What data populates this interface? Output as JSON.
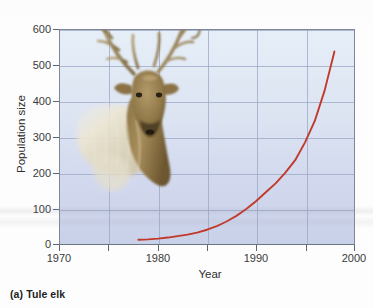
{
  "figure": {
    "caption": "(a) Tule elk",
    "photo_subject": "tule-elk-bull"
  },
  "chart_data": {
    "type": "line",
    "title": "",
    "subtitle": "",
    "xlabel": "Year",
    "ylabel": "Population size",
    "xlim": [
      1970,
      2000
    ],
    "ylim": [
      0,
      600
    ],
    "grid": true,
    "legend": null,
    "x_ticks_major": [
      1970,
      1980,
      1990,
      2000
    ],
    "x_ticks_minor": [
      1975,
      1985,
      1995
    ],
    "x_tick_labels": [
      "1970",
      "1980",
      "1990",
      "2000"
    ],
    "y_ticks": [
      0,
      100,
      200,
      300,
      400,
      500,
      600
    ],
    "y_tick_labels": [
      "0",
      "100",
      "200",
      "300",
      "400",
      "500",
      "600"
    ],
    "series": [
      {
        "name": "Tule elk population",
        "color": "#c0392b",
        "x": [
          1978,
          1979,
          1980,
          1981,
          1982,
          1983,
          1984,
          1985,
          1986,
          1987,
          1988,
          1989,
          1990,
          1991,
          1992,
          1993,
          1994,
          1995,
          1996,
          1997,
          1998
        ],
        "values": [
          12,
          13,
          15,
          18,
          22,
          26,
          32,
          40,
          50,
          63,
          79,
          98,
          120,
          145,
          170,
          200,
          235,
          285,
          345,
          430,
          540
        ]
      }
    ],
    "annotations": []
  },
  "colors": {
    "curve": "#c0392b",
    "plot_bg_top": "#e6eff8",
    "plot_bg_bottom": "#c9d1e9",
    "gridline": "#9aa6c6",
    "frame": "#7f8797",
    "text": "#2f2f2f"
  }
}
